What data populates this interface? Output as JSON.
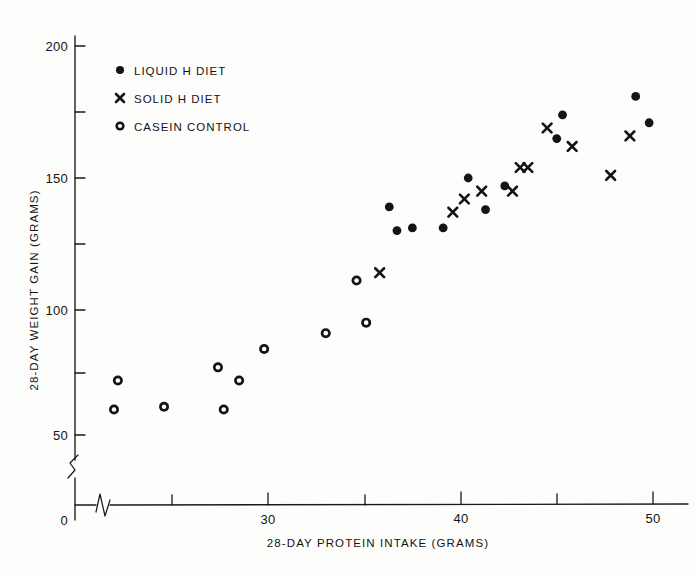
{
  "chart_data": {
    "type": "scatter",
    "title": "",
    "xlabel": "28-DAY PROTEIN INTAKE (GRAMS)",
    "ylabel": "28-DAY WEIGHT GAIN (GRAMS)",
    "xlim": [
      20,
      51
    ],
    "ylim": [
      45,
      205
    ],
    "grid": false,
    "axis_break": true,
    "origin_label": "0",
    "x_ticks_major": [
      30,
      40,
      50
    ],
    "x_ticks_major_labels": [
      "30",
      "40",
      "50"
    ],
    "x_ticks_minor": [
      25,
      35,
      45
    ],
    "y_ticks_major": [
      50,
      100,
      150,
      200
    ],
    "y_ticks_major_labels": [
      "50",
      "100",
      "150",
      "200"
    ],
    "y_ticks_minor": [
      75,
      125,
      175
    ],
    "legend_position": "upper-left-inside",
    "series": [
      {
        "name": "LIQUID H DIET",
        "marker": "filled-circle",
        "color": "#141414",
        "points": [
          [
            36.3,
            139
          ],
          [
            36.7,
            130
          ],
          [
            37.5,
            131
          ],
          [
            39.1,
            131
          ],
          [
            40.4,
            150
          ],
          [
            41.3,
            138
          ],
          [
            42.3,
            147
          ],
          [
            45.3,
            174
          ],
          [
            45.0,
            165
          ],
          [
            49.1,
            181
          ],
          [
            49.8,
            171
          ]
        ]
      },
      {
        "name": "SOLID H DIET",
        "marker": "cross",
        "color": "#141414",
        "points": [
          [
            39.6,
            137
          ],
          [
            40.2,
            142
          ],
          [
            41.1,
            145
          ],
          [
            43.1,
            154
          ],
          [
            43.5,
            154
          ],
          [
            42.7,
            145
          ],
          [
            44.5,
            169
          ],
          [
            45.8,
            162
          ],
          [
            47.8,
            151
          ],
          [
            48.8,
            166
          ],
          [
            35.8,
            114
          ]
        ]
      },
      {
        "name": "CASEIN CONTROL",
        "marker": "open-circle",
        "color": "#141414",
        "points": [
          [
            22.2,
            73
          ],
          [
            22.0,
            62
          ],
          [
            24.6,
            63
          ],
          [
            27.4,
            78
          ],
          [
            27.7,
            62
          ],
          [
            28.5,
            73
          ],
          [
            29.8,
            85
          ],
          [
            33.0,
            91
          ],
          [
            34.6,
            111
          ],
          [
            35.1,
            95
          ]
        ]
      }
    ]
  },
  "legend": {
    "items": [
      {
        "marker": "filled-circle",
        "label": "LIQUID H DIET"
      },
      {
        "marker": "cross",
        "label": "SOLID H DIET"
      },
      {
        "marker": "open-circle",
        "label": "CASEIN CONTROL"
      }
    ]
  }
}
